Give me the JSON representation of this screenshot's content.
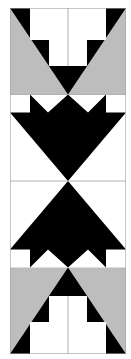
{
  "colors": {
    "black": "#000000",
    "gray": "#bdbdbd",
    "white": "#ffffff",
    "line": "#a0a0a0"
  },
  "blocks": [
    {
      "name": "top-block",
      "background": "gray",
      "motif": "T-shape in inverted triangle"
    },
    {
      "name": "upper-middle-block",
      "background": "white",
      "motif": "downward tulip/arrow"
    },
    {
      "name": "lower-middle-block",
      "background": "white",
      "motif": "upward tulip/arrow"
    },
    {
      "name": "bottom-block",
      "background": "gray",
      "motif": "inverted T-shape in triangle"
    }
  ]
}
